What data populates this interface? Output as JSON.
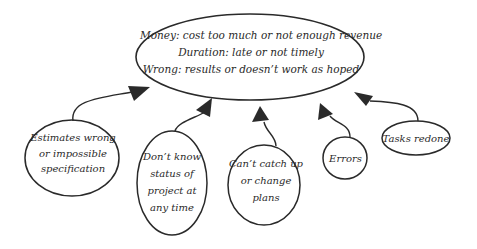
{
  "diagram": {
    "root": {
      "lines": [
        "Money: cost too much or not enough revenue",
        "Duration: late or not timely",
        "Wrong: results or doesn’t work as hoped"
      ]
    },
    "causes": [
      {
        "id": "estimates",
        "lines": [
          "Estimates wrong",
          "or impossible",
          "specification"
        ]
      },
      {
        "id": "status",
        "lines": [
          "Don’t know",
          "status of",
          "project at",
          "any time"
        ]
      },
      {
        "id": "catchup",
        "lines": [
          "Can’t catch up",
          "or change",
          "plans"
        ]
      },
      {
        "id": "errors",
        "lines": [
          "Errors"
        ]
      },
      {
        "id": "tasks",
        "lines": [
          "Tasks redone"
        ]
      }
    ],
    "colors": {
      "stroke": "#2a2a2a",
      "background": "#ffffff"
    }
  }
}
